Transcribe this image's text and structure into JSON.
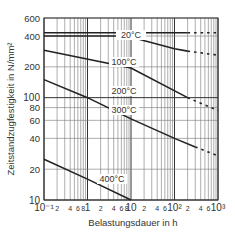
{
  "chart_data": {
    "type": "line",
    "title": "",
    "xlabel": "Belastungsdauer in h",
    "ylabel": "Zeitstandzugfestigkeit in N/mm²",
    "xscale": "log",
    "yscale": "log",
    "xlim": [
      0.1,
      1000
    ],
    "ylim": [
      10,
      600
    ],
    "grid": true,
    "x_tick_labels": [
      "10⁻¹",
      "2",
      "4",
      "6",
      "8",
      "1",
      "2",
      "4",
      "6",
      "8",
      "10",
      "2",
      "4",
      "6",
      "10²",
      "2",
      "4",
      "6",
      "10³"
    ],
    "y_tick_labels": [
      "10",
      "20",
      "40",
      "60",
      "80",
      "100",
      "200",
      "400",
      "600"
    ],
    "series": [
      {
        "name": "20°C",
        "x": [
          0.1,
          200,
          1000
        ],
        "y": [
          430,
          430,
          430
        ],
        "dashed_from": 200
      },
      {
        "name": "100°C",
        "x": [
          0.1,
          8,
          100,
          200,
          1000
        ],
        "y": [
          400,
          400,
          300,
          285,
          260
        ],
        "dashed_from": 200
      },
      {
        "name": "200°C",
        "x": [
          0.1,
          10,
          200,
          1000
        ],
        "y": [
          290,
          195,
          100,
          75
        ],
        "dashed_from": 200
      },
      {
        "name": "300°C",
        "x": [
          0.1,
          1,
          10,
          100,
          300,
          1000
        ],
        "y": [
          150,
          100,
          62,
          40,
          33,
          27
        ],
        "dashed_from": 300
      },
      {
        "name": "400°C",
        "x": [
          0.1,
          1,
          10
        ],
        "y": [
          25,
          16,
          10
        ],
        "dashed_from": null
      }
    ]
  },
  "labels": {
    "xlabel": "Belastungsdauer in h",
    "ylabel": "Zeitstandzugfestigkeit in N/mm²",
    "t20": "20°C",
    "t100": "100°C",
    "t200": "200°C",
    "t300": "300°C",
    "t400": "400°C"
  }
}
